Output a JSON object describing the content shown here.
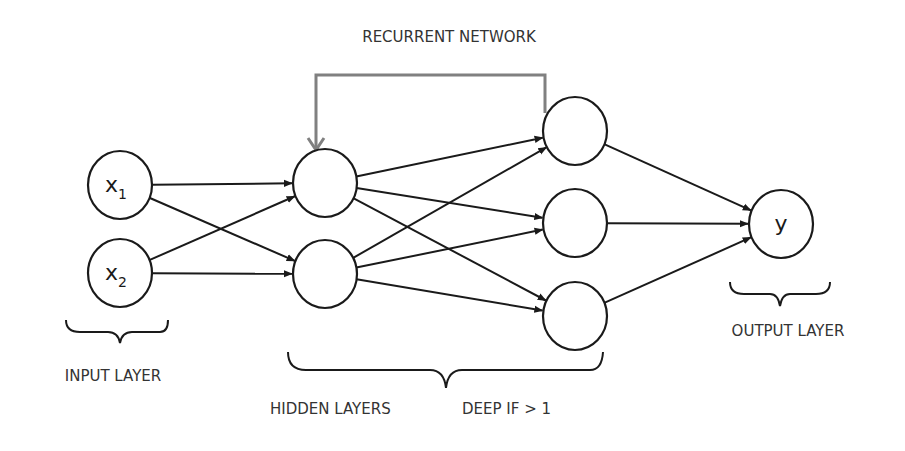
{
  "title": "RECURRENT NETWORK",
  "labels": {
    "input_layer": "INPUT LAYER",
    "hidden_layers": "HIDDEN LAYERS",
    "deep_note": "DEEP IF > 1",
    "output_layer": "OUTPUT LAYER"
  },
  "colors": {
    "edge": "#1a1a1a",
    "recurrent": "#808080",
    "node_stroke": "#1a1a1a",
    "text": "#333333"
  },
  "nodes": [
    {
      "id": "x1",
      "layer": "input",
      "label": "x",
      "sub": "1"
    },
    {
      "id": "x2",
      "layer": "input",
      "label": "x",
      "sub": "2"
    },
    {
      "id": "h1a",
      "layer": "hidden1",
      "label": "",
      "sub": ""
    },
    {
      "id": "h1b",
      "layer": "hidden1",
      "label": "",
      "sub": ""
    },
    {
      "id": "h2a",
      "layer": "hidden2",
      "label": "",
      "sub": ""
    },
    {
      "id": "h2b",
      "layer": "hidden2",
      "label": "",
      "sub": ""
    },
    {
      "id": "h2c",
      "layer": "hidden2",
      "label": "",
      "sub": ""
    },
    {
      "id": "y",
      "layer": "output",
      "label": "y",
      "sub": ""
    }
  ],
  "edges": [
    [
      "x1",
      "h1a"
    ],
    [
      "x1",
      "h1b"
    ],
    [
      "x2",
      "h1a"
    ],
    [
      "x2",
      "h1b"
    ],
    [
      "h1a",
      "h2a"
    ],
    [
      "h1a",
      "h2b"
    ],
    [
      "h1a",
      "h2c"
    ],
    [
      "h1b",
      "h2a"
    ],
    [
      "h1b",
      "h2b"
    ],
    [
      "h1b",
      "h2c"
    ],
    [
      "h2a",
      "y"
    ],
    [
      "h2b",
      "y"
    ],
    [
      "h2c",
      "y"
    ]
  ],
  "recurrent_edge": [
    "h2a",
    "h1a"
  ]
}
